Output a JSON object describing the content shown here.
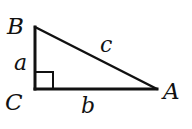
{
  "diagram": {
    "vertices": [
      {
        "id": "A",
        "label": "A",
        "x": 157,
        "y": 89
      },
      {
        "id": "B",
        "label": "B",
        "x": 35,
        "y": 27
      },
      {
        "id": "C",
        "label": "C",
        "x": 35,
        "y": 89
      }
    ],
    "sides": [
      {
        "id": "a",
        "label": "a",
        "from": "B",
        "to": "C"
      },
      {
        "id": "b",
        "label": "b",
        "from": "C",
        "to": "A"
      },
      {
        "id": "c",
        "label": "c",
        "from": "B",
        "to": "A"
      }
    ],
    "right_angle_at": "C",
    "stroke_color": "#111111",
    "background_color": "#ffffff"
  }
}
